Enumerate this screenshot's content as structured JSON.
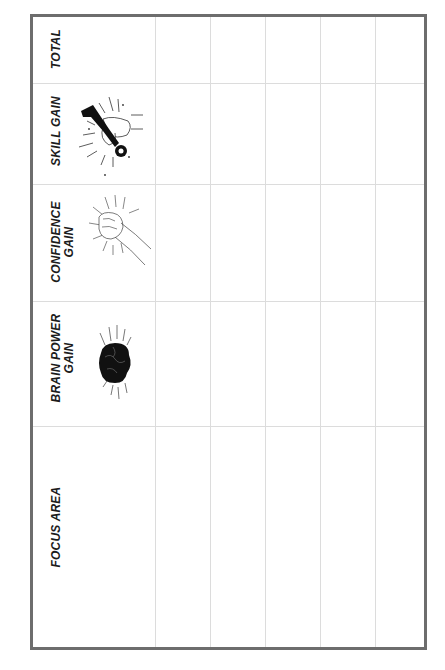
{
  "worksheet": {
    "columns": [
      {
        "key": "total",
        "label": "TOTAL",
        "icon": null
      },
      {
        "key": "skill_gain",
        "label": "SKILL GAIN",
        "icon": "hand-wrench-icon"
      },
      {
        "key": "confidence_gain",
        "label_line1": "CONFIDENCE",
        "label_line2": "GAIN",
        "icon": "fist-icon"
      },
      {
        "key": "brain_power_gain",
        "label_line1": "BRAIN POWER",
        "label_line2": "GAIN",
        "icon": "brain-icon"
      },
      {
        "key": "focus_area",
        "label": "FOCUS AREA",
        "icon": null
      }
    ],
    "rows": [
      {
        "focus_area": "",
        "brain_power_gain": "",
        "confidence_gain": "",
        "skill_gain": "",
        "total": ""
      },
      {
        "focus_area": "",
        "brain_power_gain": "",
        "confidence_gain": "",
        "skill_gain": "",
        "total": ""
      },
      {
        "focus_area": "",
        "brain_power_gain": "",
        "confidence_gain": "",
        "skill_gain": "",
        "total": ""
      },
      {
        "focus_area": "",
        "brain_power_gain": "",
        "confidence_gain": "",
        "skill_gain": "",
        "total": ""
      },
      {
        "focus_area": "",
        "brain_power_gain": "",
        "confidence_gain": "",
        "skill_gain": "",
        "total": ""
      }
    ],
    "colors": {
      "frame": "#6d6d6d",
      "grid": "#dcdcdc",
      "text": "#1c1c1c"
    }
  }
}
